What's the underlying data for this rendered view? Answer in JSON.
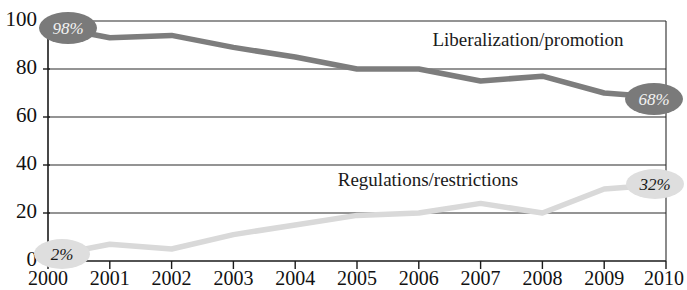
{
  "chart_data": {
    "type": "line",
    "title": "",
    "subtitle": "",
    "xlabel": "",
    "ylabel": "",
    "x": [
      2000,
      2001,
      2002,
      2003,
      2004,
      2005,
      2006,
      2007,
      2008,
      2009,
      2010
    ],
    "categories": [
      "2000",
      "2001",
      "2002",
      "2003",
      "2004",
      "2005",
      "2006",
      "2007",
      "2008",
      "2009",
      "2010"
    ],
    "xlim": [
      2000,
      2010
    ],
    "ylim": [
      0,
      100
    ],
    "yticks": [
      0,
      20,
      40,
      60,
      80,
      100
    ],
    "ytick_labels": [
      "0",
      "20",
      "40",
      "60",
      "80",
      "100"
    ],
    "grid": true,
    "grid_axis": "y",
    "legend": "inline-labels",
    "series": [
      {
        "name": "Liberalization/promotion",
        "color": "#7d7d7d",
        "values": [
          98,
          93,
          94,
          89,
          85,
          80,
          80,
          75,
          77,
          70,
          68
        ],
        "label_text": "Liberalization/promotion",
        "start_label": "98%",
        "end_label": "68%"
      },
      {
        "name": "Regulations/restrictions",
        "color": "#d9d9d9",
        "values": [
          2,
          7,
          5,
          11,
          15,
          19,
          20,
          24,
          20,
          30,
          32
        ],
        "label_text": "Regulations/restrictions",
        "start_label": "2%",
        "end_label": "32%"
      }
    ],
    "annotations": [
      {
        "text": "98%",
        "x": 2000,
        "y": 98,
        "style": "dark-badge"
      },
      {
        "text": "68%",
        "x": 2010,
        "y": 68,
        "style": "dark-badge"
      },
      {
        "text": "2%",
        "x": 2000,
        "y": 2,
        "style": "light-badge"
      },
      {
        "text": "32%",
        "x": 2010,
        "y": 32,
        "style": "light-badge"
      }
    ]
  },
  "axis": {
    "y_labels": [
      "100",
      "80",
      "60",
      "40",
      "20",
      "0"
    ],
    "x_labels": [
      "2000",
      "2001",
      "2002",
      "2003",
      "2004",
      "2005",
      "2006",
      "2007",
      "2008",
      "2009",
      "2010"
    ]
  },
  "labels": {
    "liberalization": "Liberalization/promotion",
    "regulations": "Regulations/restrictions",
    "badge_lib_start": "98%",
    "badge_lib_end": "68%",
    "badge_reg_start": "2%",
    "badge_reg_end": "32%"
  }
}
